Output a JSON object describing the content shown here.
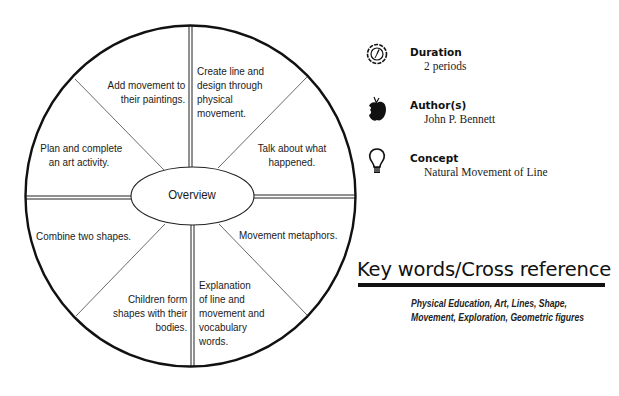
{
  "diagram": {
    "center_label": "Overview",
    "segments": [
      {
        "position": "top-left",
        "lines": [
          "Add movement to",
          "their paintings."
        ]
      },
      {
        "position": "top-right",
        "lines": [
          "Create line and",
          "design through",
          "physical",
          "movement."
        ]
      },
      {
        "position": "upper-right",
        "lines": [
          "Talk about what",
          "happened."
        ]
      },
      {
        "position": "lower-right",
        "lines": [
          "Movement metaphors."
        ]
      },
      {
        "position": "bottom-right",
        "lines": [
          "Explanation",
          "of line and",
          "movement and",
          "vocabulary",
          "words."
        ]
      },
      {
        "position": "bottom-left",
        "lines": [
          "Children form",
          "shapes with their",
          "bodies."
        ]
      },
      {
        "position": "lower-left",
        "lines": [
          "Combine two shapes."
        ]
      },
      {
        "position": "upper-left",
        "lines": [
          "Plan and complete",
          "an art activity."
        ]
      }
    ]
  },
  "info": {
    "duration": {
      "title": "Duration",
      "value": "2 periods",
      "icon": "clock-badge-icon"
    },
    "authors": {
      "title": "Author(s)",
      "value": "John P. Bennett",
      "icon": "apple-icon"
    },
    "concept": {
      "title": "Concept",
      "value": "Natural Movement of Line",
      "icon": "lightbulb-icon"
    }
  },
  "keywords": {
    "title": "Key words/Cross reference",
    "text": "Physical Education, Art, Lines, Shape, Movement, Exploration, Geometric figures"
  }
}
